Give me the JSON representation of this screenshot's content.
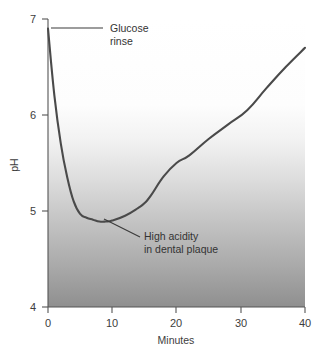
{
  "chart_data": {
    "type": "line",
    "title": "",
    "subtitle": "",
    "xlabel": "Minutes",
    "ylabel": "pH",
    "xlim": [
      0,
      40
    ],
    "ylim": [
      4,
      7
    ],
    "xticks": [
      0,
      10,
      20,
      30,
      40
    ],
    "xtick_labels": [
      "0",
      "10",
      "20",
      "30",
      "40"
    ],
    "yticks": [
      4,
      5,
      6,
      7
    ],
    "ytick_labels": [
      "4",
      "5",
      "6",
      "7"
    ],
    "grid": false,
    "legend": false,
    "legend_position": "none",
    "background": "vertical gradient, white at top fading to grey at bottom",
    "series": [
      {
        "name": "Plaque pH after glucose rinse",
        "color": "#4a4a4a",
        "x": [
          0,
          1,
          2,
          3,
          4,
          5,
          6,
          7,
          8,
          9,
          10,
          12,
          14,
          15,
          16,
          18,
          20,
          22,
          25,
          28,
          31,
          34,
          37,
          40
        ],
        "y": [
          6.9,
          6.2,
          5.7,
          5.35,
          5.1,
          4.97,
          4.93,
          4.91,
          4.89,
          4.89,
          4.9,
          4.95,
          5.03,
          5.08,
          5.16,
          5.36,
          5.5,
          5.58,
          5.75,
          5.9,
          6.05,
          6.28,
          6.5,
          6.7
        ]
      }
    ],
    "annotations": [
      {
        "id": "glucose-rinse",
        "lines": [
          "Glucose",
          "rinse"
        ],
        "points_to": {
          "x": 0,
          "y": 6.9
        },
        "leader": "horizontal"
      },
      {
        "id": "high-acidity",
        "lines": [
          "High acidity",
          "in dental plaque"
        ],
        "points_to": {
          "x": 9,
          "y": 4.89
        },
        "leader": "diagonal"
      }
    ],
    "colors": {
      "line": "#4a4a4a",
      "axis": "#555555",
      "text": "#3d3d3d",
      "gradient_top": "#ffffff",
      "gradient_bottom": "#8f8f8f"
    }
  }
}
